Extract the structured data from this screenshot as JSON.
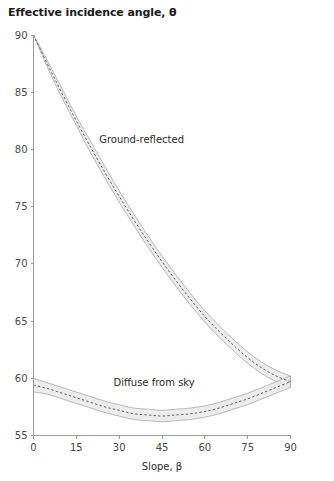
{
  "chart_data": {
    "type": "line",
    "title": "Effective incidence angle, θ",
    "xlabel": "Slope, β",
    "ylabel": "Effective incidence angle, θ",
    "xlim": [
      0,
      90
    ],
    "ylim": [
      55,
      90
    ],
    "xticks": [
      0,
      15,
      30,
      45,
      60,
      75,
      90
    ],
    "yticks": [
      55,
      60,
      65,
      70,
      75,
      80,
      85,
      90
    ],
    "xtick_labels": [
      "0",
      "15",
      "30",
      "45",
      "60",
      "75",
      "90"
    ],
    "ytick_labels": [
      "55",
      "60",
      "65",
      "70",
      "75",
      "80",
      "85",
      "90"
    ],
    "grid": false,
    "legend_position": "inline-annotation",
    "x": [
      0,
      5,
      10,
      15,
      20,
      25,
      30,
      35,
      40,
      45,
      50,
      55,
      60,
      65,
      70,
      75,
      80,
      85,
      90
    ],
    "series": [
      {
        "name": "Ground-reflected",
        "label": "Ground-reflected",
        "style": "dashed-center-with-uncertainty-band",
        "values": [
          90.0,
          87.4,
          84.9,
          82.5,
          80.2,
          78.0,
          75.9,
          73.9,
          72.0,
          70.2,
          68.5,
          66.9,
          65.4,
          64.1,
          62.9,
          61.8,
          60.9,
          60.2,
          59.7
        ],
        "band_upper": [
          90.0,
          87.7,
          85.3,
          82.9,
          80.7,
          78.5,
          76.4,
          74.4,
          72.5,
          70.7,
          69.0,
          67.4,
          65.9,
          64.6,
          63.4,
          62.3,
          61.4,
          60.7,
          60.2
        ],
        "band_lower": [
          90.0,
          87.1,
          84.5,
          82.1,
          79.7,
          77.5,
          75.4,
          73.4,
          71.5,
          69.7,
          68.0,
          66.4,
          64.9,
          63.6,
          62.4,
          61.3,
          60.4,
          59.7,
          59.2
        ]
      },
      {
        "name": "Diffuse from sky",
        "label": "Diffuse from sky",
        "style": "dashed-center-with-uncertainty-band",
        "values": [
          59.4,
          59.1,
          58.7,
          58.3,
          57.9,
          57.5,
          57.2,
          56.9,
          56.8,
          56.7,
          56.8,
          56.9,
          57.1,
          57.4,
          57.8,
          58.2,
          58.7,
          59.2,
          59.7
        ],
        "band_upper": [
          60.0,
          59.6,
          59.2,
          58.8,
          58.4,
          58.0,
          57.7,
          57.4,
          57.3,
          57.2,
          57.3,
          57.4,
          57.6,
          57.9,
          58.3,
          58.7,
          59.2,
          59.7,
          60.2
        ],
        "band_lower": [
          58.8,
          58.6,
          58.2,
          57.8,
          57.4,
          57.0,
          56.7,
          56.4,
          56.3,
          56.2,
          56.3,
          56.4,
          56.6,
          56.9,
          57.3,
          57.7,
          58.2,
          58.7,
          59.2
        ]
      }
    ],
    "annotations": [
      {
        "text": "Ground-reflected",
        "x": 23,
        "y": 80.6
      },
      {
        "text": "Diffuse from sky",
        "x": 28,
        "y": 59.3
      }
    ],
    "colors": {
      "band_fill": "#e9e9e9",
      "band_stroke": "#9d9d9d",
      "center_line": "#5e5e5e",
      "axis": "#9a9a9a",
      "text": "#2a2a2a",
      "title": "#1a1a1a"
    }
  }
}
